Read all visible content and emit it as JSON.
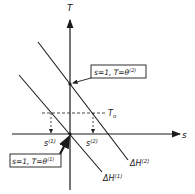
{
  "diagram": {
    "axes": {
      "y_label": "T",
      "x_label": "s"
    },
    "reference_line": {
      "label": "T",
      "subscript": "o"
    },
    "lines": [
      {
        "name": "ΔH",
        "superscript": "(1)"
      },
      {
        "name": "ΔH",
        "superscript": "(2)"
      }
    ],
    "points": [
      {
        "label": "s",
        "superscript": "(1)"
      },
      {
        "label": "s",
        "superscript": "(2)"
      }
    ],
    "callouts": [
      {
        "text": "s=1, T=θ",
        "superscript": "(2)"
      },
      {
        "text": "s=1, T=θ",
        "superscript": "(1)"
      }
    ],
    "colors": {
      "ink": "#1a1a1a",
      "background": "#ffffff"
    }
  }
}
